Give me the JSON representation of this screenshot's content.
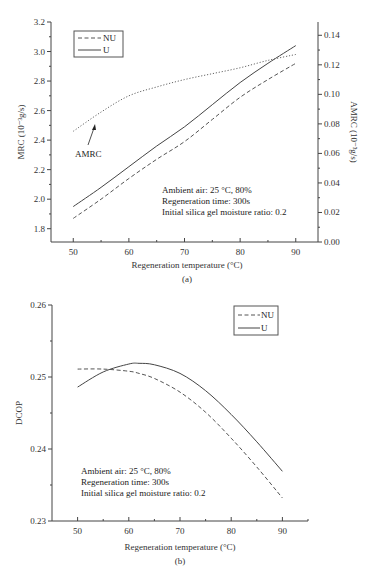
{
  "chart_data": [
    {
      "id": "a",
      "type": "line",
      "caption": "(a)",
      "title": "",
      "xlabel": "Regeneration temperature (°C)",
      "ylabel": "MRC (10⁻³g/s)",
      "ylabel_right": "AMRC (10⁻³g/s)",
      "xlim": [
        46,
        94
      ],
      "ylim": [
        1.71,
        3.2
      ],
      "ylim_right": [
        0.0,
        0.149
      ],
      "x_ticks": [
        50,
        60,
        70,
        80,
        90
      ],
      "x_tick_labels": [
        "50",
        "60",
        "70",
        "80",
        "90"
      ],
      "y_ticks": [
        1.8,
        2.0,
        2.2,
        2.4,
        2.6,
        2.8,
        3.0,
        3.2
      ],
      "y_tick_labels": [
        "1.8",
        "2.0",
        "2.2",
        "2.4",
        "2.6",
        "2.8",
        "3.0",
        "3.2"
      ],
      "y_right_ticks": [
        0.0,
        0.02,
        0.04,
        0.06,
        0.08,
        0.1,
        0.12,
        0.14
      ],
      "y_right_tick_labels": [
        "0.00",
        "0.02",
        "0.04",
        "0.06",
        "0.08",
        "0.10",
        "0.12",
        "0.14"
      ],
      "grid": false,
      "legend": {
        "position": "top-left",
        "entries": [
          {
            "label": "NU",
            "style": "dashed"
          },
          {
            "label": "U",
            "style": "solid"
          }
        ]
      },
      "x": [
        50,
        55,
        60,
        65,
        70,
        75,
        80,
        85,
        90
      ],
      "series": [
        {
          "name": "U",
          "axis": "left",
          "style": "solid",
          "values": [
            1.95,
            2.08,
            2.22,
            2.36,
            2.49,
            2.64,
            2.79,
            2.92,
            3.04
          ]
        },
        {
          "name": "NU",
          "axis": "left",
          "style": "dashed",
          "values": [
            1.87,
            2.0,
            2.14,
            2.27,
            2.39,
            2.54,
            2.69,
            2.81,
            2.92
          ]
        },
        {
          "name": "AMRC",
          "axis": "right",
          "style": "dotted",
          "values": [
            0.075,
            0.088,
            0.099,
            0.105,
            0.11,
            0.114,
            0.118,
            0.123,
            0.127
          ]
        }
      ],
      "annotations": {
        "amrc_label": "AMRC",
        "conditions": [
          "Ambient air: 25 °C, 80%",
          "Regeneration time: 300s",
          "Initial silica gel moisture ratio: 0.2"
        ]
      }
    },
    {
      "id": "b",
      "type": "line",
      "caption": "(b)",
      "title": "",
      "xlabel": "Regeneration temperature (°C)",
      "ylabel": "DCOP",
      "xlim": [
        45,
        95
      ],
      "ylim": [
        0.23,
        0.26
      ],
      "x_ticks": [
        50,
        60,
        70,
        80,
        90
      ],
      "x_tick_labels": [
        "50",
        "60",
        "70",
        "80",
        "90"
      ],
      "y_ticks": [
        0.23,
        0.24,
        0.25,
        0.26
      ],
      "y_tick_labels": [
        "0.23",
        "0.24",
        "0.25",
        "0.26"
      ],
      "grid": false,
      "legend": {
        "position": "top-right",
        "entries": [
          {
            "label": "NU",
            "style": "dashed"
          },
          {
            "label": "U",
            "style": "solid"
          }
        ]
      },
      "x": [
        50,
        55,
        60,
        62,
        65,
        70,
        75,
        80,
        85,
        90
      ],
      "series": [
        {
          "name": "U",
          "style": "solid",
          "values": [
            0.2486,
            0.2507,
            0.2518,
            0.2519,
            0.2517,
            0.2505,
            0.2481,
            0.2448,
            0.241,
            0.2369
          ]
        },
        {
          "name": "NU",
          "style": "dashed",
          "values": [
            0.2511,
            0.2511,
            0.2508,
            0.2505,
            0.2498,
            0.2479,
            0.2451,
            0.2415,
            0.2375,
            0.2332
          ]
        }
      ],
      "annotations": {
        "conditions": [
          "Ambient air: 25 °C, 80%",
          "Regeneration time: 300s",
          "Initial silica gel moisture ratio: 0.2"
        ]
      }
    }
  ]
}
